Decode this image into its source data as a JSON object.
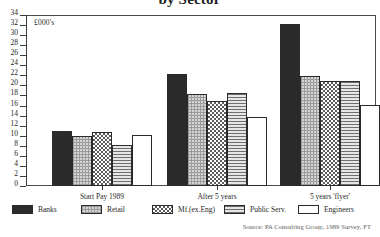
{
  "chart_data": {
    "type": "bar",
    "title": "by Sector",
    "units_label": "£000's",
    "xlabel": "",
    "ylabel": "",
    "ylim": [
      0,
      34
    ],
    "ytick_step": 2,
    "grid": false,
    "legend_position": "bottom",
    "categories": [
      "Start Pay 1989",
      "After 5 years",
      "5 years 'flyer'"
    ],
    "series": [
      {
        "name": "Banks",
        "values": [
          11.0,
          22.3,
          32.3
        ],
        "swatch": "solid-dark"
      },
      {
        "name": "Retail",
        "values": [
          9.9,
          18.2,
          21.9
        ],
        "swatch": "fine-grid"
      },
      {
        "name": "Mf.(ex.Eng)",
        "values": [
          10.8,
          17.0,
          20.8
        ],
        "swatch": "checker"
      },
      {
        "name": "Public Serv.",
        "values": [
          8.1,
          18.5,
          20.8
        ],
        "swatch": "horizontal-lines"
      },
      {
        "name": "Engineers",
        "values": [
          10.2,
          13.8,
          16.2
        ],
        "swatch": "white"
      }
    ],
    "ytick_labels": [
      "0",
      "2",
      "4",
      "6",
      "8",
      "10",
      "12",
      "14",
      "16",
      "18",
      "20",
      "22",
      "24",
      "26",
      "28",
      "30",
      "32",
      "34"
    ],
    "source": "Source: PA Consulting Group, 1989 Survey, FT"
  }
}
